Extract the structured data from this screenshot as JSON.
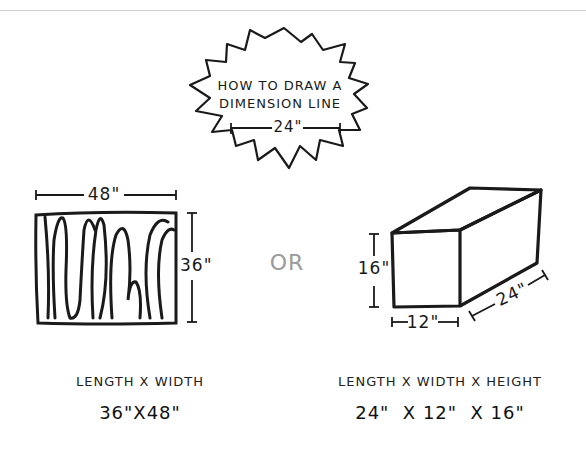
{
  "header": {
    "title_line1": "HOW TO DRAW A",
    "title_line2": "DIMENSION LINE",
    "example_dimension": "24\""
  },
  "left_figure": {
    "shape": "rectangle (wood panel)",
    "width_label": "48\"",
    "height_label": "36\"",
    "formula_label": "LENGTH X WIDTH",
    "formula_value": "36\"X48\""
  },
  "separator": {
    "label": "OR",
    "color": "#9a9a9a"
  },
  "right_figure": {
    "shape": "rectangular box",
    "height_label": "16\"",
    "width_label": "12\"",
    "length_label": "24\"",
    "formula_label": "LENGTH X WIDTH X HEIGHT",
    "formula_value": "24\"  X 12\"  X 16\""
  },
  "colors": {
    "ink": "#1a1a1a",
    "background": "#ffffff",
    "rule": "#cfcfcf"
  }
}
